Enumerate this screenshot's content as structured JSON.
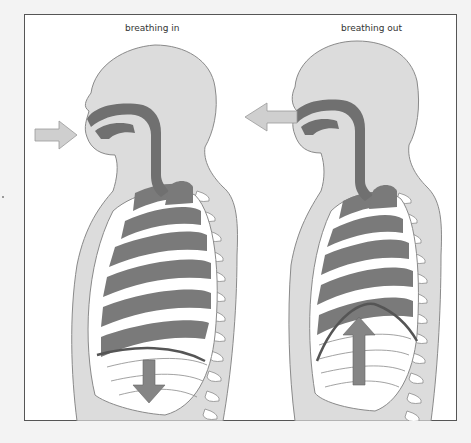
{
  "figure": {
    "panels": [
      {
        "id": "in",
        "label": "breathing in",
        "airflow": "into mouth",
        "diaphragm": "moves down"
      },
      {
        "id": "out",
        "label": "breathing out",
        "airflow": "out of mouth",
        "diaphragm": "moves up"
      }
    ]
  },
  "colors": {
    "background": "#f3f3f3",
    "frame": "#ffffff",
    "body": "#dcdcdc",
    "outline": "#8a8a8a",
    "airway": "#707070",
    "lung": "#7a7a7a",
    "rib": "#ffffff",
    "arrow": "#cfcfcf",
    "diaphragm_arrow": "#858585"
  }
}
